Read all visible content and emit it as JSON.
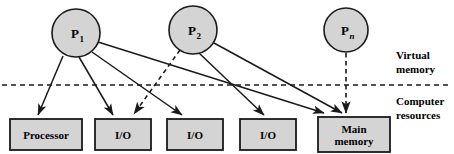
{
  "diagram": {
    "processes": [
      {
        "id": "p1",
        "label": "P",
        "subscript": "1",
        "subscript_style": "upright",
        "cx": 76,
        "cy": 33,
        "r": 24
      },
      {
        "id": "p2",
        "label": "P",
        "subscript": "2",
        "subscript_style": "upright",
        "cx": 193,
        "cy": 30,
        "r": 24
      },
      {
        "id": "pn",
        "label": "P",
        "subscript": "n",
        "subscript_style": "italic",
        "cx": 346,
        "cy": 30,
        "r": 22
      }
    ],
    "resources": [
      {
        "id": "processor",
        "label": "Processor",
        "lines": [
          "Processor"
        ],
        "x": 10,
        "y": 119,
        "w": 72,
        "h": 31
      },
      {
        "id": "io-1",
        "label": "I/O",
        "lines": [
          "I/O"
        ],
        "x": 95,
        "y": 119,
        "w": 56,
        "h": 31
      },
      {
        "id": "io-2",
        "label": "I/O",
        "lines": [
          "I/O"
        ],
        "x": 167,
        "y": 119,
        "w": 56,
        "h": 31
      },
      {
        "id": "io-3",
        "label": "I/O",
        "lines": [
          "I/O"
        ],
        "x": 240,
        "y": 119,
        "w": 56,
        "h": 31
      },
      {
        "id": "main-memory",
        "label": "Main memory",
        "lines": [
          "Main",
          "memory"
        ],
        "x": 318,
        "y": 117,
        "w": 72,
        "h": 35
      }
    ],
    "divider": {
      "y": 85,
      "x1": 2,
      "x2": 452,
      "style": "dashed"
    },
    "region_labels": [
      {
        "id": "virtual-memory",
        "lines": [
          "Virtual",
          "memory"
        ],
        "x": 396,
        "y": 59
      },
      {
        "id": "computer-resources",
        "lines": [
          "Computer",
          "resources"
        ],
        "x": 396,
        "y": 105
      }
    ],
    "edges": [
      {
        "id": "p1-processor",
        "from": "p1",
        "to": "processor",
        "style": "solid",
        "x1": 63,
        "y1": 56,
        "x2": 38,
        "y2": 115
      },
      {
        "id": "p1-io-1",
        "from": "p1",
        "to": "io-1",
        "style": "solid",
        "x1": 79,
        "y1": 57,
        "x2": 113,
        "y2": 115
      },
      {
        "id": "p1-io-2",
        "from": "p1",
        "to": "io-2",
        "style": "solid",
        "x1": 92,
        "y1": 52,
        "x2": 182,
        "y2": 115
      },
      {
        "id": "p1-main-memory",
        "from": "p1",
        "to": "main-memory",
        "style": "solid",
        "x1": 98,
        "y1": 42,
        "x2": 324,
        "y2": 113
      },
      {
        "id": "p2-io-1-dashed",
        "from": "p2",
        "to": "io-1",
        "style": "dashed",
        "x1": 180,
        "y1": 50,
        "x2": 134,
        "y2": 114
      },
      {
        "id": "p2-io-3",
        "from": "p2",
        "to": "io-3",
        "style": "solid",
        "x1": 199,
        "y1": 53,
        "x2": 264,
        "y2": 115
      },
      {
        "id": "p2-main-memory",
        "from": "p2",
        "to": "main-memory",
        "style": "solid",
        "x1": 214,
        "y1": 43,
        "x2": 342,
        "y2": 113
      },
      {
        "id": "pn-main-memory-dashed",
        "from": "pn",
        "to": "main-memory",
        "style": "dashed",
        "x1": 346,
        "y1": 53,
        "x2": 346,
        "y2": 113
      }
    ],
    "colors": {
      "node_fill": "#d4d4d4",
      "box_fill": "#d4d4d4",
      "stroke": "#1a1a1a",
      "text": "#000000",
      "background": "#ffffff"
    }
  }
}
